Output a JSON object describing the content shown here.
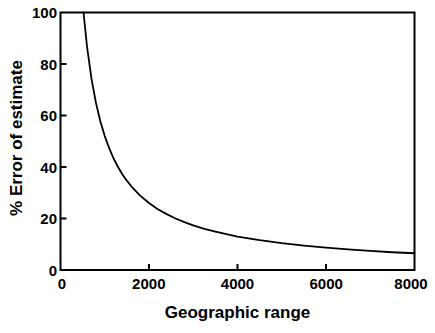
{
  "chart_data": {
    "type": "line",
    "title": "",
    "xlabel": "Geographic range",
    "ylabel": "% Error of estimate",
    "xlim": [
      0,
      8000
    ],
    "ylim": [
      0,
      100
    ],
    "xticks": [
      0,
      2000,
      4000,
      6000,
      8000
    ],
    "xtick_labels": [
      "0",
      "2000",
      "4000",
      "6000",
      "8000"
    ],
    "yticks": [
      0,
      20,
      40,
      60,
      80,
      100
    ],
    "ytick_labels": [
      "0",
      "20",
      "40",
      "60",
      "80",
      "100"
    ],
    "grid": false,
    "legend": null,
    "line_color": "#000000",
    "frame_color": "#000000",
    "background": "#ffffff",
    "series": [
      {
        "name": "% Error of estimate",
        "x": [
          520,
          600,
          700,
          800,
          900,
          1000,
          1100,
          1200,
          1300,
          1400,
          1500,
          1600,
          1800,
          2000,
          2200,
          2400,
          2600,
          2800,
          3000,
          3250,
          3500,
          3750,
          4000,
          4500,
          5000,
          5500,
          6000,
          6500,
          7000,
          7500,
          8000
        ],
        "y": [
          100.0,
          86.7,
          74.3,
          65.0,
          57.8,
          52.0,
          47.3,
          43.3,
          40.0,
          37.1,
          34.7,
          32.5,
          28.9,
          26.0,
          23.6,
          21.7,
          20.0,
          18.6,
          17.3,
          16.0,
          14.9,
          13.9,
          13.0,
          11.6,
          10.4,
          9.5,
          8.7,
          8.0,
          7.4,
          6.9,
          6.5
        ]
      }
    ],
    "annotations": []
  }
}
